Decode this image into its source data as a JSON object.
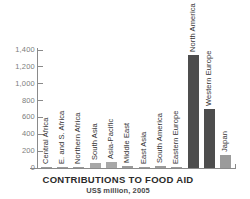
{
  "chart_data": {
    "type": "bar",
    "title": "CONTRIBUTIONS TO FOOD AID",
    "subtitle": "US$ million, 2005",
    "xlabel": "",
    "ylabel": "",
    "ylim": [
      0,
      1400
    ],
    "yticks": [
      0,
      200,
      400,
      600,
      800,
      1000,
      1200,
      1400
    ],
    "ytick_labels": [
      "0",
      "200",
      "400",
      "600",
      "800",
      "1,000",
      "1,200",
      "1,400"
    ],
    "grid": false,
    "legend": false,
    "categories": [
      "Central Africa",
      "E. and S. Africa",
      "Northern Africa",
      "South Asia",
      "Asia-Pacific",
      "Middle East",
      "East Asia",
      "South America",
      "Eastern Europe",
      "North America",
      "Western Europe",
      "Japan"
    ],
    "values": [
      5,
      15,
      12,
      55,
      75,
      18,
      4,
      20,
      8,
      1340,
      700,
      155
    ],
    "bar_colors": [
      "#9b9b9b",
      "#9b9b9b",
      "#9b9b9b",
      "#a8a8a8",
      "#a8a8a8",
      "#9b9b9b",
      "#9b9b9b",
      "#9b9b9b",
      "#9b9b9b",
      "#4d4d4d",
      "#4d4d4d",
      "#9b9b9b"
    ]
  },
  "colors": {
    "axis": "#8a8a8a",
    "tick_text": "#7d7d7d",
    "label_text": "#333333",
    "title_text": "#2b2b2b",
    "bar_dark": "#4d4d4d",
    "bar_light": "#a8a8a8",
    "background": "#ffffff"
  }
}
